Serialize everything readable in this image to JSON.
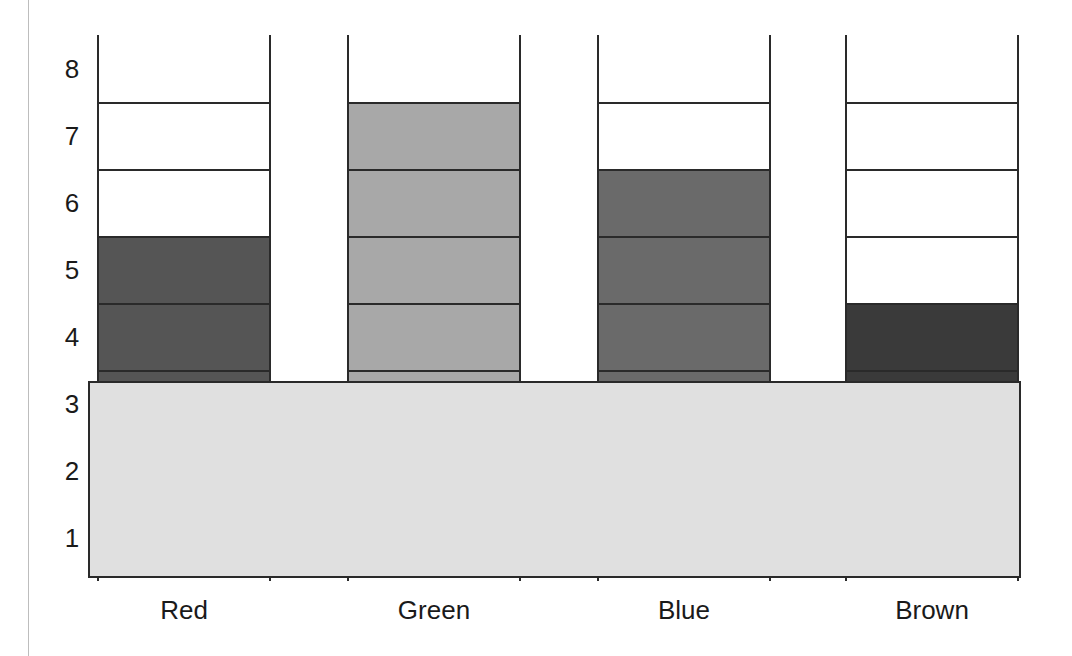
{
  "chart_data": {
    "type": "bar",
    "title": "",
    "xlabel": "",
    "ylabel": "",
    "categories": [
      "Red",
      "Green",
      "Blue",
      "Brown"
    ],
    "values": [
      5,
      7,
      6,
      4
    ],
    "ylim": [
      0,
      8
    ],
    "yticks": [
      "1",
      "2",
      "3",
      "4",
      "5",
      "6",
      "7",
      "8"
    ],
    "grid": false,
    "legend": null,
    "annotations": [
      "Rows 1-3 of every column are hidden behind an overlapping light-gray rectangle"
    ],
    "colors": {
      "Red": "#555555",
      "Green": "#a8a8a8",
      "Blue": "#6a6a6a",
      "Brown": "#3a3a3a",
      "empty": "#ffffff",
      "cover": "#e0e0e0"
    }
  }
}
